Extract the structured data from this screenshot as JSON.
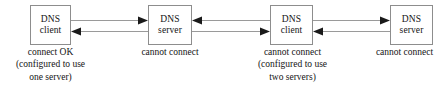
{
  "diagram": {
    "background_color": "#ffffff",
    "box_border_color": "#8d8d8d",
    "line_color": "#9a9a9a",
    "arrow_color": "#1a1a1a",
    "text_color": "#141414",
    "nodes": [
      {
        "id": "node-1",
        "role": "dns-client",
        "label_line1": "DNS",
        "label_line2": "client",
        "x": 30,
        "y": 5,
        "w": 41,
        "h": 40,
        "caption": {
          "status": "connect OK",
          "note_line1": "(configured to use",
          "note_line2": "one server)",
          "x": 1,
          "y": 46,
          "w": 99
        }
      },
      {
        "id": "node-2",
        "role": "dns-server",
        "label_line1": "DNS",
        "label_line2": "server",
        "x": 148,
        "y": 5,
        "w": 44,
        "h": 40,
        "caption": {
          "status": "cannot connect",
          "note_line1": "",
          "note_line2": "",
          "x": 124,
          "y": 46,
          "w": 92
        }
      },
      {
        "id": "node-3",
        "role": "dns-client",
        "label_line1": "DNS",
        "label_line2": "client",
        "x": 270,
        "y": 5,
        "w": 43,
        "h": 40,
        "caption": {
          "status": "cannot connect",
          "note_line1": "(configured to use",
          "note_line2": "two servers)",
          "x": 243,
          "y": 46,
          "w": 99
        }
      },
      {
        "id": "node-4",
        "role": "dns-server",
        "label_line1": "DNS",
        "label_line2": "server",
        "x": 390,
        "y": 5,
        "w": 43,
        "h": 40,
        "caption": {
          "status": "cannot connect",
          "note_line1": "",
          "note_line2": "",
          "x": 362,
          "y": 46,
          "w": 85
        }
      }
    ],
    "edges": [
      {
        "id": "edge-1-top",
        "from": "node-1",
        "to": "node-2",
        "direction": "right",
        "x1": 71,
        "x2": 148,
        "y": 20
      },
      {
        "id": "edge-1-bottom",
        "from": "node-2",
        "to": "node-1",
        "direction": "left",
        "x1": 71,
        "x2": 148,
        "y": 31
      },
      {
        "id": "edge-2-top",
        "from": "node-3",
        "to": "node-2",
        "direction": "left",
        "x1": 192,
        "x2": 270,
        "y": 20
      },
      {
        "id": "edge-2-bottom",
        "from": "node-2",
        "to": "node-3",
        "direction": "right",
        "x1": 192,
        "x2": 270,
        "y": 31
      },
      {
        "id": "edge-3-top",
        "from": "node-3",
        "to": "node-4",
        "direction": "right",
        "x1": 313,
        "x2": 390,
        "y": 20
      },
      {
        "id": "edge-3-bottom",
        "from": "node-4",
        "to": "node-3",
        "direction": "left",
        "x1": 313,
        "x2": 390,
        "y": 31
      }
    ]
  }
}
